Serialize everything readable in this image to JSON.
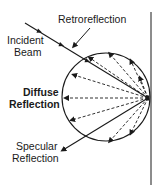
{
  "diagram": {
    "labels": {
      "retroreflection": "Retroreflection",
      "incident_line1": "Incident",
      "incident_line2": "Beam",
      "diffuse_line1": "Diffuse",
      "diffuse_line2": "Reflection",
      "specular_line1": "Specular",
      "specular_line2": "Reflection"
    },
    "colors": {
      "stroke": "#1a1a1a",
      "background": "#ffffff"
    }
  }
}
